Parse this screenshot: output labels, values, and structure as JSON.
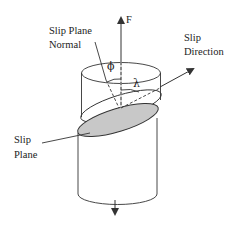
{
  "diagram": {
    "type": "slip-system-schematic",
    "labels": {
      "force": "F",
      "slip_plane_normal_line1": "Slip Plane",
      "slip_plane_normal_line2": "Normal",
      "slip_direction_line1": "Slip",
      "slip_direction_line2": "Direction",
      "slip_plane_line1": "Slip",
      "slip_plane_line2": "Plane",
      "phi": "ϕ",
      "lambda": "λ"
    },
    "colors": {
      "stroke": "#333333",
      "slip_plane_fill": "#c8c8c8",
      "background": "#ffffff"
    }
  }
}
